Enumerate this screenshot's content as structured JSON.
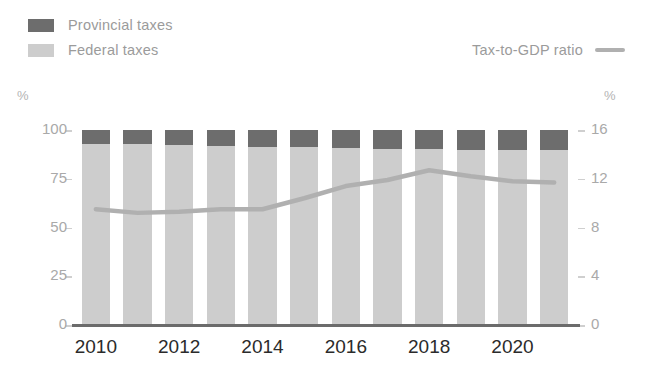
{
  "legend": {
    "items": [
      {
        "label": "Provincial taxes",
        "color": "#6d6d6d",
        "type": "swatch"
      },
      {
        "label": "Federal taxes",
        "color": "#cdcdcd",
        "type": "swatch"
      }
    ],
    "line_item": {
      "label": "Tax-to-GDP ratio",
      "color": "#b0b0b0",
      "type": "line"
    }
  },
  "axes": {
    "left_unit": "%",
    "right_unit": "%",
    "left_ticks": [
      "0",
      "25",
      "50",
      "75",
      "100"
    ],
    "right_ticks": [
      "0",
      "4",
      "8",
      "12",
      "16"
    ]
  },
  "chart_data": {
    "type": "bar",
    "title": "",
    "subtitle": "",
    "xlabel": "",
    "ylabel": "%",
    "y2label": "%",
    "grid": false,
    "legend_position": "top",
    "stacked": true,
    "categories": [
      "2010",
      "2011",
      "2012",
      "2013",
      "2014",
      "2015",
      "2016",
      "2017",
      "2018",
      "2019",
      "2020",
      "2021"
    ],
    "tick_labels": [
      "2010",
      "",
      "2012",
      "",
      "2014",
      "",
      "2016",
      "",
      "2018",
      "",
      "2020",
      ""
    ],
    "ylim": [
      0,
      100
    ],
    "y2lim": [
      0,
      16
    ],
    "series": [
      {
        "name": "Federal taxes",
        "axis": "left",
        "color": "#cdcdcd",
        "values": [
          93.0,
          93.0,
          92.5,
          92.0,
          91.5,
          91.5,
          91.0,
          90.5,
          90.5,
          90.0,
          90.0,
          90.0
        ]
      },
      {
        "name": "Provincial taxes",
        "axis": "left",
        "color": "#6d6d6d",
        "values": [
          7.0,
          7.0,
          7.5,
          8.0,
          8.5,
          8.5,
          9.0,
          9.5,
          9.5,
          10.0,
          10.0,
          10.0
        ]
      },
      {
        "name": "Tax-to-GDP ratio",
        "axis": "right",
        "color": "#b0b0b0",
        "type": "line",
        "values": [
          9.5,
          9.2,
          9.3,
          9.5,
          9.5,
          10.4,
          11.4,
          11.9,
          12.7,
          12.2,
          11.8,
          11.7
        ]
      }
    ]
  }
}
